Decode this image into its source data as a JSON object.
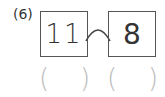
{
  "problem": {
    "label": "(6)",
    "left_box_value": "11",
    "right_box_value": "8",
    "connector": "arc-icon",
    "answer_blanks": [
      {
        "open": "(",
        "close": ")"
      },
      {
        "open": "(",
        "close": ")"
      }
    ]
  },
  "colors": {
    "border": "#555555",
    "text": "#333333",
    "paren": "#bbbbbb"
  }
}
